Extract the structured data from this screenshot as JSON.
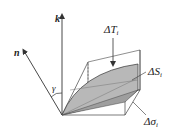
{
  "diagram": {
    "vectors": {
      "k": {
        "label": "k"
      },
      "n": {
        "label": "n"
      }
    },
    "angle": {
      "label": "γ"
    },
    "annotations": {
      "delta_T": {
        "prefix": "ΔT",
        "subscript": "i"
      },
      "delta_S": {
        "prefix": "ΔS",
        "subscript": "i"
      },
      "delta_sigma": {
        "prefix": "Δσ",
        "subscript": "i"
      }
    },
    "colors": {
      "line": "#333333",
      "surface_fill": "#b8b8b8",
      "background": "#ffffff"
    }
  }
}
